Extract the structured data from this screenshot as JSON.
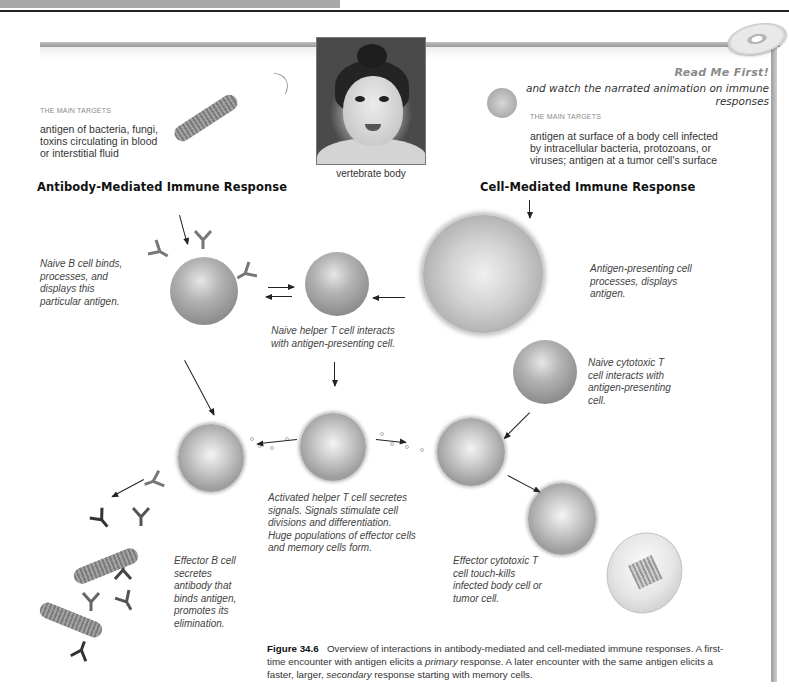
{
  "header": {
    "has_top_gray_bar": true
  },
  "cd_promo": {
    "icon": "cd-disc-icon",
    "title": "Read Me First!",
    "subtitle": "and watch the narrated animation on immune responses"
  },
  "photo": {
    "caption": "vertebrate body"
  },
  "antibody_mediated": {
    "targets_label": "THE MAIN TARGETS",
    "targets_text": "antigen of bacteria, fungi, toxins circulating in blood or interstitial fluid",
    "heading": "Antibody-Mediated Immune Response"
  },
  "cell_mediated": {
    "targets_label": "THE MAIN TARGETS",
    "targets_text": "antigen at surface of a body cell infected by intracellular bacteria, protozoans, or viruses; antigen at a tumor cell's surface",
    "heading": "Cell-Mediated Immune Response"
  },
  "steps": {
    "naive_b_cell": "Naive B cell binds, processes, and displays this particular antigen.",
    "naive_helper_t": "Naive helper T cell interacts with antigen-presenting cell.",
    "apc": "Antigen-presenting cell processes, displays antigen.",
    "naive_cytotoxic_t": "Naive cytotoxic T cell interacts with antigen-presenting cell.",
    "activated_helper_t": "Activated helper T cell secretes signals. Signals stimulate cell divisions and differentiation. Huge populations of effector cells and memory cells form.",
    "effector_b": "Effector B cell secretes antibody that binds antigen, promotes its elimination.",
    "effector_cytotoxic_t": "Effector cytotoxic T cell touch-kills infected body cell or tumor cell."
  },
  "figure_caption": {
    "label": "Figure 34.6",
    "text_1": "Overview of interactions in antibody-mediated and cell-mediated immune responses. A first-time encounter with antigen elicits a ",
    "em_1": "primary",
    "text_2": " response. A later encounter with the same antigen elicits a faster, larger, ",
    "em_2": "secondary",
    "text_3": " response starting with memory cells."
  },
  "colors": {
    "frame": "#a8a8a8",
    "text": "#333333",
    "heading": "#111111",
    "muted": "#8a8a8a"
  }
}
